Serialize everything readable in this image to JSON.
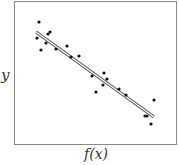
{
  "chart_data": {
    "type": "scatter",
    "title": "",
    "xlabel": "f(x)",
    "ylabel": "y",
    "grid": false,
    "legend": null,
    "xlim": [
      0,
      1
    ],
    "ylim": [
      0,
      1
    ],
    "points_px": [
      [
        39,
        22
      ],
      [
        37,
        38
      ],
      [
        41,
        50
      ],
      [
        46,
        43
      ],
      [
        48,
        34
      ],
      [
        50,
        32
      ],
      [
        56,
        49
      ],
      [
        67,
        46
      ],
      [
        71,
        57
      ],
      [
        79,
        56
      ],
      [
        92,
        76
      ],
      [
        96,
        92
      ],
      [
        103,
        85
      ],
      [
        104,
        73
      ],
      [
        107,
        79
      ],
      [
        119,
        89
      ],
      [
        126,
        95
      ],
      [
        145,
        116
      ],
      [
        147,
        116
      ],
      [
        151,
        124
      ],
      [
        154,
        100
      ]
    ],
    "fit_line_px": [
      [
        36,
        32
      ],
      [
        154,
        117
      ]
    ],
    "trend": "negative linear",
    "colors": {
      "points": "#111111",
      "line": "#555555",
      "frame": "#888888"
    }
  },
  "labels": {
    "x": "f(x)",
    "y": "y"
  }
}
